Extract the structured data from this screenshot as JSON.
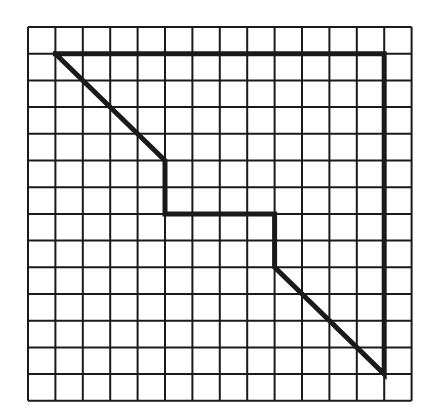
{
  "figure": {
    "type": "grid-polygon",
    "grid": {
      "columns": 14,
      "rows": 14,
      "origin_px": [
        28,
        27
      ],
      "cell_w_px": 27.4,
      "cell_h_px": 26.7,
      "line_color": "#1a1a1a",
      "line_width": 2
    },
    "polygon": {
      "description": "Closed polygon drawn with thick lines on square grid",
      "vertices_grid": [
        [
          1,
          1
        ],
        [
          13,
          1
        ],
        [
          13,
          13
        ],
        [
          9,
          9
        ],
        [
          9,
          7
        ],
        [
          5,
          7
        ],
        [
          5,
          5
        ],
        [
          1,
          1
        ]
      ],
      "stroke_color": "#1a1a1a",
      "stroke_width": 5
    },
    "background": "#ffffff"
  }
}
